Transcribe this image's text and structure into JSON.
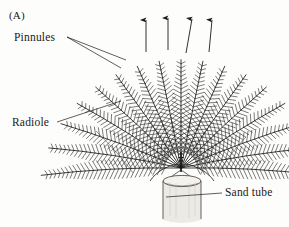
{
  "figure": {
    "panel_letter": "(A)",
    "background_color": "#fdfdfb",
    "ink_color": "#1a1a1a"
  },
  "labels": {
    "pinnules": "Pinnules",
    "radiole": "Radiole",
    "sand_tube": "Sand tube"
  },
  "annotations": {
    "flow_arrows": {
      "count": 4,
      "direction": "up",
      "meaning": "water-current-direction"
    }
  },
  "diagram": {
    "crown": {
      "radiole_count": 17,
      "origin_x": 181,
      "origin_y": 168,
      "spread_degrees": 186,
      "tip_radius_min": 96,
      "tip_radius_max": 140,
      "pinnule_spacing": 4.2,
      "pinnule_length": 7.5
    },
    "tube": {
      "left": 163,
      "right": 201,
      "top": 178,
      "bottom": 224,
      "fill_color": "#e9e7e2",
      "rim_color": "#55504a"
    },
    "guide_lines": 4
  }
}
